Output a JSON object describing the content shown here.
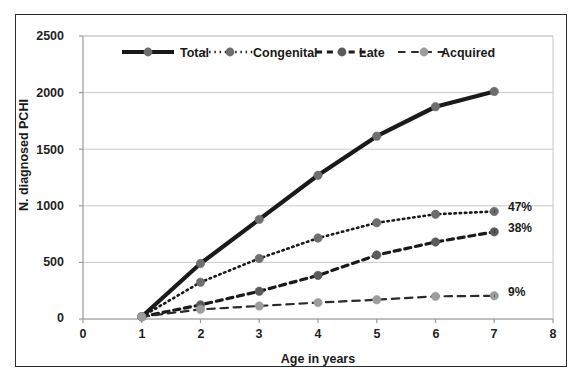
{
  "chart_data": {
    "type": "line",
    "title": "",
    "xlabel": "Age in years",
    "ylabel": "N. diagnosed PCHI",
    "x": [
      1,
      2,
      3,
      4,
      5,
      6,
      7
    ],
    "xlim": [
      0,
      8
    ],
    "ylim": [
      0,
      2500
    ],
    "xticks": [
      "0",
      "1",
      "2",
      "3",
      "4",
      "5",
      "6",
      "7",
      "8"
    ],
    "yticks": [
      "0",
      "500",
      "1000",
      "1500",
      "2000",
      "2500"
    ],
    "grid": "horizontal",
    "legend_position": "top-inside",
    "series": [
      {
        "name": "Total",
        "values": [
          20,
          490,
          880,
          1270,
          1615,
          1875,
          2010
        ],
        "color": "#1a1a1a",
        "style": "solid",
        "width": 4.2,
        "marker_color": "#6e6e6e",
        "annotation": ""
      },
      {
        "name": "Congenital",
        "values": [
          20,
          325,
          535,
          715,
          850,
          925,
          950
        ],
        "color": "#1a1a1a",
        "style": "dotted",
        "width": 2.6,
        "marker_color": "#6e6e6e",
        "annotation": "47%"
      },
      {
        "name": "Late",
        "values": [
          20,
          125,
          245,
          385,
          565,
          680,
          770
        ],
        "color": "#1a1a1a",
        "style": "dashed",
        "width": 3.2,
        "marker_color": "#5a5a5a",
        "annotation": "38%"
      },
      {
        "name": "Acquired",
        "values": [
          20,
          85,
          115,
          145,
          170,
          200,
          205
        ],
        "color": "#2b2b2b",
        "style": "dashed-light",
        "width": 2.2,
        "marker_color": "#9d9d9d",
        "annotation": "9%"
      }
    ],
    "annotations": [
      {
        "text": "47%",
        "series": "Congenital",
        "x": 7,
        "y": 950
      },
      {
        "text": "38%",
        "series": "Late",
        "x": 7,
        "y": 770
      },
      {
        "text": "9%",
        "series": "Acquired",
        "x": 7,
        "y": 205
      }
    ]
  },
  "colors": {
    "frame": "#2b2b2b",
    "grid": "#c9c9c9",
    "axis_text": "#1f1f1f",
    "background": "#ffffff"
  }
}
